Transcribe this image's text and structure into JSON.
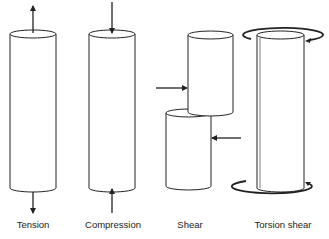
{
  "diagram": {
    "stroke_color": "#222222",
    "panels": [
      {
        "id": "tension",
        "label": "Tension"
      },
      {
        "id": "compression",
        "label": "Compression"
      },
      {
        "id": "shear",
        "label": "Shear"
      },
      {
        "id": "torsion",
        "label": "Torsion shear"
      }
    ]
  }
}
